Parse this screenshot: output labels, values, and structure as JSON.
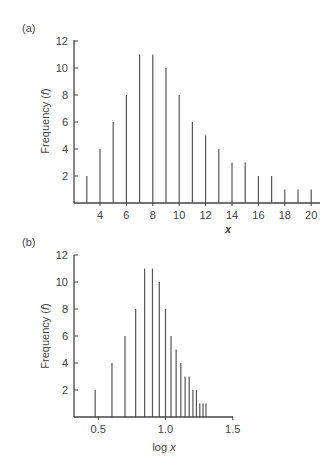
{
  "panels": [
    {
      "label": "(a)",
      "xlabel_text": "x",
      "ylabel_text": "Frequency (f)"
    },
    {
      "label": "(b)",
      "xlabel_text": "log x",
      "ylabel_text": "Frequency (f)"
    }
  ],
  "chart_data": [
    {
      "type": "bar",
      "title": "(a)",
      "style": "stem (vertical lines)",
      "xlabel": "x",
      "ylabel": "Frequency (f)",
      "x": [
        3,
        4,
        5,
        6,
        7,
        8,
        9,
        10,
        11,
        12,
        13,
        14,
        15,
        16,
        17,
        18,
        19,
        20
      ],
      "values": [
        2,
        4,
        6,
        8,
        11,
        11,
        10,
        8,
        6,
        5,
        4,
        3,
        3,
        2,
        2,
        1,
        1,
        1
      ],
      "xticks": [
        4,
        6,
        8,
        10,
        12,
        14,
        16,
        18,
        20
      ],
      "yticks": [
        2,
        4,
        6,
        8,
        10,
        12
      ],
      "ylim": [
        0,
        12
      ],
      "xlim": [
        2,
        20.8
      ],
      "grid": false,
      "legend": null
    },
    {
      "type": "bar",
      "title": "(b)",
      "style": "stem (vertical lines)",
      "xlabel": "log x",
      "ylabel": "Frequency (f)",
      "x": [
        0.477,
        0.602,
        0.699,
        0.778,
        0.845,
        0.903,
        0.954,
        1.0,
        1.041,
        1.079,
        1.114,
        1.146,
        1.176,
        1.204,
        1.23,
        1.255,
        1.279,
        1.301
      ],
      "values": [
        2,
        4,
        6,
        8,
        11,
        11,
        10,
        8,
        6,
        5,
        4,
        3,
        3,
        2,
        2,
        1,
        1,
        1
      ],
      "xticks": [
        0.5,
        1.0,
        1.5
      ],
      "xtick_labels": [
        "0.5",
        "1.0",
        "1.5"
      ],
      "yticks": [
        2,
        4,
        6,
        8,
        10,
        12
      ],
      "ylim": [
        0,
        12
      ],
      "xlim": [
        0.32,
        1.5
      ],
      "grid": false,
      "legend": null
    }
  ]
}
